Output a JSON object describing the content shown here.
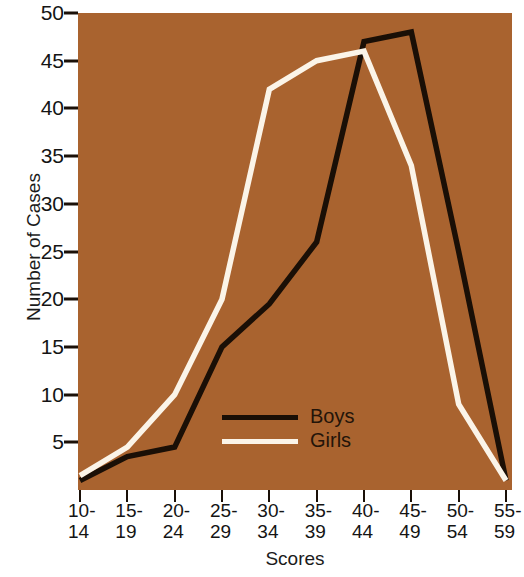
{
  "chart_data": {
    "type": "line",
    "title": "",
    "xlabel": "Scores",
    "ylabel": "Number of Cases",
    "categories": [
      "10-14",
      "15-19",
      "20-24",
      "25-29",
      "30-34",
      "35-39",
      "40-44",
      "45-49",
      "50-54",
      "55-59"
    ],
    "series": [
      {
        "name": "Boys",
        "color": "#1a0f06",
        "values": [
          1,
          3.5,
          4.5,
          15,
          19.5,
          26,
          47,
          48,
          25,
          1
        ]
      },
      {
        "name": "Girls",
        "color": "#fbf4e8",
        "values": [
          1.5,
          4.5,
          10,
          20,
          42,
          45,
          46,
          34,
          9,
          1
        ]
      }
    ],
    "ylim": [
      0,
      50
    ],
    "yticks": [
      5,
      10,
      15,
      20,
      25,
      30,
      35,
      40,
      45,
      50
    ],
    "ytick_labels": [
      "5",
      "10",
      "15",
      "20",
      "25",
      "30",
      "35",
      "40",
      "45",
      "50"
    ],
    "grid": false,
    "legend_position": "inside-lower-center",
    "plot_background": "#a9632f",
    "figure_background": "#ffffff"
  },
  "axes": {
    "y_title": "Number of Cases",
    "x_title": "Scores"
  },
  "legend": {
    "entries": [
      {
        "label": "Boys"
      },
      {
        "label": "Girls"
      }
    ]
  }
}
